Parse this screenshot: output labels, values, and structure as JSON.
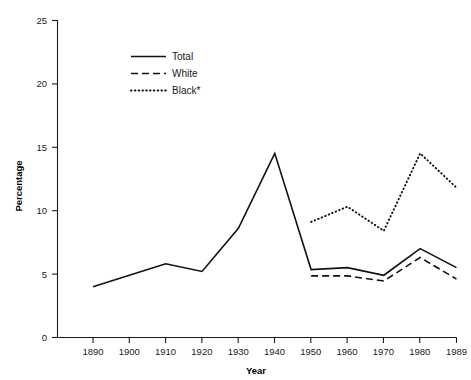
{
  "chart_data": {
    "type": "line",
    "title": "",
    "xlabel": "Year",
    "ylabel": "Percentage",
    "x": [
      1890,
      1900,
      1910,
      1920,
      1930,
      1940,
      1950,
      1960,
      1970,
      1980,
      1989
    ],
    "categories": [
      "1890",
      "1900",
      "1910",
      "1920",
      "1930",
      "1940",
      "1950",
      "1960",
      "1970",
      "1980",
      "1989"
    ],
    "xlim": [
      1885,
      1994
    ],
    "ylim": [
      0,
      25
    ],
    "yticks": [
      0,
      5,
      10,
      15,
      20,
      25
    ],
    "ytick_labels": [
      "0",
      "5",
      "10",
      "15",
      "20",
      "25"
    ],
    "grid": false,
    "legend_position": "upper-left-inside",
    "series": [
      {
        "name": "Total",
        "style": "solid",
        "x": [
          1890,
          1900,
          1910,
          1920,
          1930,
          1940,
          1950,
          1960,
          1970,
          1980,
          1989
        ],
        "values": [
          4.0,
          4.9,
          5.8,
          5.2,
          8.6,
          14.5,
          5.35,
          5.5,
          4.9,
          7.0,
          5.5
        ]
      },
      {
        "name": "White",
        "style": "dashed",
        "x": [
          1950,
          1960,
          1970,
          1980,
          1989
        ],
        "values": [
          4.85,
          4.85,
          4.45,
          6.3,
          4.6
        ]
      },
      {
        "name": "Black*",
        "style": "dotted",
        "x": [
          1950,
          1960,
          1970,
          1980,
          1989
        ],
        "values": [
          9.1,
          10.3,
          8.4,
          14.5,
          11.8
        ]
      }
    ]
  },
  "axes": {
    "y_title": "Percentage",
    "x_title": "Year",
    "y_tick_labels": [
      "25",
      "20",
      "15",
      "10",
      "5",
      "0"
    ],
    "x_tick_labels": [
      "1890",
      "1900",
      "1910",
      "1920",
      "1930",
      "1940",
      "1950",
      "1960",
      "1970",
      "1980",
      "1989"
    ]
  },
  "legend": {
    "items": [
      {
        "label": "Total",
        "style": "solid"
      },
      {
        "label": "White",
        "style": "dashed"
      },
      {
        "label": "Black*",
        "style": "dotted"
      }
    ]
  },
  "colors": {
    "line": "#111111",
    "axis": "#1a1a1a",
    "text": "#1a1a1a",
    "background": "#ffffff"
  }
}
